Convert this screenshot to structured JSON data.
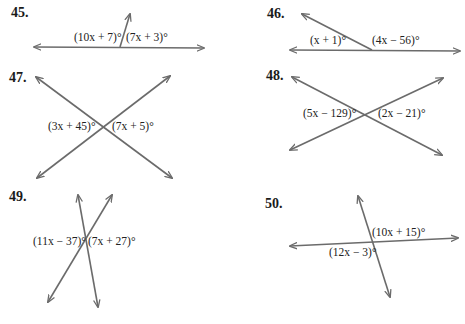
{
  "problems": [
    {
      "number": "45.",
      "labels": [
        "(10x + 7)°",
        "(7x + 3)°"
      ],
      "type": "linear-pair"
    },
    {
      "number": "46.",
      "labels": [
        "(x + 1)°",
        "(4x − 56)°"
      ],
      "type": "linear-pair"
    },
    {
      "number": "47.",
      "labels": [
        "(3x + 45)°",
        "(7x + 5)°"
      ],
      "type": "intersecting-lines"
    },
    {
      "number": "48.",
      "labels": [
        "(5x − 129)°",
        "(2x − 21)°"
      ],
      "type": "intersecting-lines"
    },
    {
      "number": "49.",
      "labels": [
        "(11x − 37)°",
        "(7x + 27)°"
      ],
      "type": "intersecting-lines"
    },
    {
      "number": "50.",
      "labels": [
        "(10x + 15)°",
        "(12x − 3)°"
      ],
      "type": "intersecting-lines"
    }
  ],
  "colors": {
    "line": "#6b6b6b",
    "text": "#222222"
  }
}
